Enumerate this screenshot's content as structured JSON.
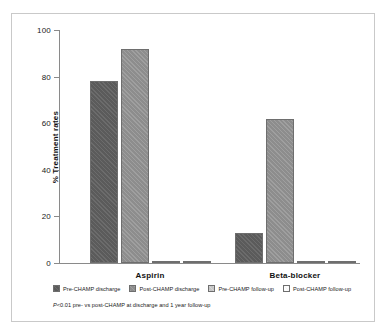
{
  "chart_data": {
    "type": "bar",
    "title": "",
    "xlabel": "",
    "ylabel": "% Treatment rates",
    "ylim": [
      0,
      100
    ],
    "yticks": [
      0,
      20,
      40,
      60,
      80,
      100
    ],
    "grid": false,
    "legend_position": "bottom",
    "categories": [
      "Aspirin",
      "Beta-blocker"
    ],
    "series": [
      {
        "name": "Pre-CHAMP discharge",
        "values": [
          78,
          13
        ],
        "color": "#5b5b5b"
      },
      {
        "name": "Post-CHAMP discharge",
        "values": [
          92,
          62
        ],
        "color": "#8d8d8d"
      },
      {
        "name": "Pre-CHAMP follow-up",
        "values": [
          68,
          19
        ],
        "color": "#c6c6c6"
      },
      {
        "name": "Post-CHAMP follow-up",
        "values": [
          94,
          58
        ],
        "color": "#fdfdfd"
      }
    ],
    "annotations": [
      "P<0.01 pre- vs post-CHAMP at discharge and 1 year follow-up"
    ]
  },
  "axis": {
    "y_title": "% Treatment rates",
    "ticks": [
      "100",
      "80",
      "60",
      "40",
      "20",
      "0"
    ]
  },
  "groups": [
    {
      "label": "Aspirin"
    },
    {
      "label": "Beta-blocker"
    }
  ],
  "legend": {
    "items": [
      {
        "label": "Pre-CHAMP discharge"
      },
      {
        "label": "Post-CHAMP discharge"
      },
      {
        "label": "Pre-CHAMP follow-up"
      },
      {
        "label": "Post-CHAMP follow-up"
      }
    ]
  },
  "footnote": {
    "stat": "P",
    "text": "<0.01 pre- vs post-CHAMP at discharge and 1 year follow-up"
  }
}
